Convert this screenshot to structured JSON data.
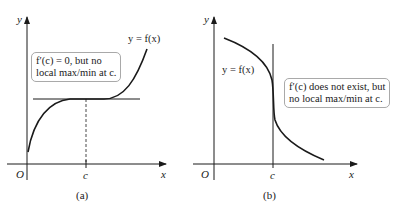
{
  "panel_a": {
    "caption": "(a)",
    "curve_label": "y = f(x)",
    "note_line1_prefix": "f′(c) = 0, but no",
    "note_line2": "local max/min at c.",
    "axis_x": "x",
    "axis_y": "y",
    "origin": "O",
    "tick_c": "c"
  },
  "panel_b": {
    "caption": "(b)",
    "curve_label": "y = f(x)",
    "note_line1": "f′(c) does not exist, but",
    "note_line2": "no local max/min at c.",
    "axis_x": "x",
    "axis_y": "y",
    "origin": "O",
    "tick_c": "c"
  },
  "colors": {
    "ink": "#1a1a1a",
    "box_border": "#a9a9a9"
  }
}
